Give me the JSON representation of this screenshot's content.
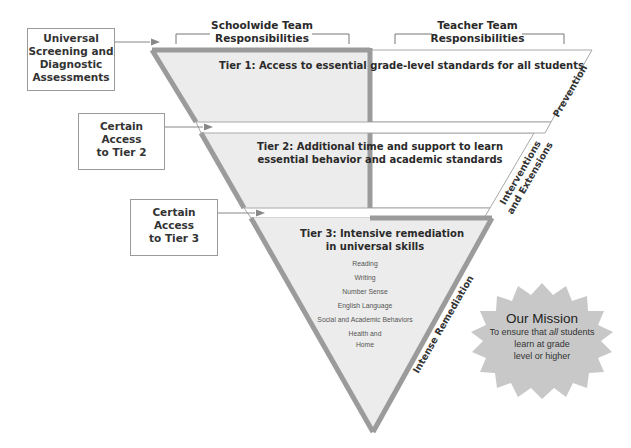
{
  "headers": {
    "schoolwide": "Schoolwide Team Responsibilities",
    "schoolwide_line1": "Schoolwide Team",
    "schoolwide_line2": "Responsibilities",
    "teacher_line1": "Teacher Team",
    "teacher_line2": "Responsibilities"
  },
  "input_boxes": [
    {
      "lines": [
        "Universal",
        "Screening and",
        "Diagnostic",
        "Assessments"
      ]
    },
    {
      "lines": [
        "Certain Access",
        "to Tier 2"
      ]
    },
    {
      "lines": [
        "Certain Access",
        "to Tier 3"
      ]
    }
  ],
  "tiers": [
    {
      "title": "Tier 1: Access to essential grade-level standards for all students",
      "side_label": "Prevention"
    },
    {
      "title_line1": "Tier 2: Additional time and support to learn",
      "title_line2": "essential behavior and academic standards",
      "side_label_line1": "Interventions",
      "side_label_line2": "and Extensions"
    },
    {
      "title_line1": "Tier 3: Intensive remediation",
      "title_line2": "in universal skills",
      "side_label": "Intense Remediation",
      "skills": [
        "Reading",
        "Writing",
        "Number Sense",
        "English Language",
        "Social and Academic Behaviors",
        "Health and",
        "Home"
      ]
    }
  ],
  "mission": {
    "title": "Our Mission",
    "line1_pre": "To ensure that ",
    "line1_em": "all",
    "line1_post": " students",
    "line2": "learn at grade",
    "line3": "level or higher"
  },
  "colors": {
    "schoolwide_fill": "#ececec",
    "border_gray": "#9b9b9b",
    "mission_fill": "#c8c8c8",
    "outline": "#aaaaaa"
  }
}
